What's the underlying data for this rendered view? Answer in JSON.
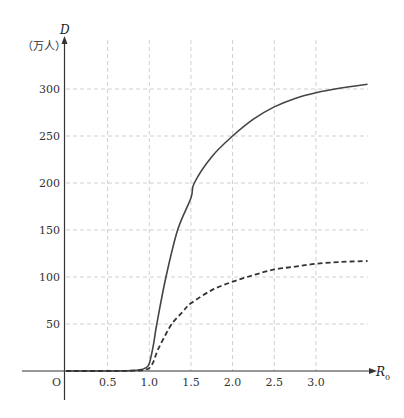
{
  "chart_data": {
    "type": "line",
    "title": "",
    "xlabel": "R0",
    "xlabel_main": "R",
    "xlabel_sub": "0",
    "ylabel": "D",
    "yunit": "（万人）",
    "origin_label": "O",
    "xlim": [
      0,
      3.65
    ],
    "ylim": [
      0,
      320
    ],
    "x_ticks": [
      0.5,
      1.0,
      1.5,
      2.0,
      2.5,
      3.0
    ],
    "x_tick_labels": [
      "0.5",
      "1.0",
      "1.5",
      "2.0",
      "2.5",
      "3.0"
    ],
    "y_ticks": [
      50,
      100,
      150,
      200,
      250,
      300
    ],
    "y_tick_labels": [
      "50",
      "100",
      "150",
      "200",
      "250",
      "300"
    ],
    "grid": true,
    "series": [
      {
        "name": "solid",
        "style": "solid",
        "x": [
          0,
          0.5,
          0.8,
          0.9,
          0.95,
          1.0,
          1.05,
          1.09,
          1.2,
          1.34,
          1.5,
          1.54,
          1.75,
          2.0,
          2.25,
          2.5,
          2.75,
          3.0,
          3.3,
          3.62
        ],
        "y": [
          0,
          0,
          0.5,
          1.5,
          3,
          8,
          28,
          50,
          100,
          150,
          184,
          200,
          228,
          250,
          268,
          281,
          290,
          296,
          301,
          305
        ]
      },
      {
        "name": "dashed",
        "style": "dashed",
        "x": [
          0,
          0.5,
          0.8,
          0.9,
          0.95,
          1.0,
          1.05,
          1.1,
          1.18,
          1.27,
          1.4,
          1.5,
          1.75,
          2.0,
          2.25,
          2.5,
          2.75,
          3.0,
          3.3,
          3.62
        ],
        "y": [
          0,
          0,
          0.3,
          0.8,
          1.5,
          3,
          10,
          22,
          36,
          50,
          63,
          72,
          86,
          95,
          102,
          108,
          111,
          114,
          116,
          117
        ]
      }
    ]
  }
}
